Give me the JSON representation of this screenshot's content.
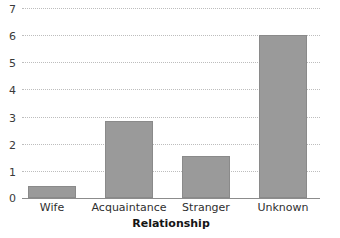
{
  "chart_data": {
    "type": "bar",
    "title": "",
    "subtitle": "",
    "xlabel": "Relationship",
    "ylabel": "",
    "categories": [
      "Wife",
      "Acquaintance",
      "Stranger",
      "Unknown"
    ],
    "values": [
      0.45,
      2.85,
      1.55,
      6.0
    ],
    "series": [
      {
        "name": "Count",
        "values": [
          0.45,
          2.85,
          1.55,
          6.0
        ]
      }
    ],
    "ylim": [
      0,
      7
    ],
    "ytick_labels": [
      "0",
      "1",
      "2",
      "3",
      "4",
      "5",
      "6",
      "7"
    ],
    "ytick_values": [
      0,
      1,
      2,
      3,
      4,
      5,
      6,
      7
    ],
    "xtick_labels": [
      "Wife",
      "Acquaintance",
      "Stranger",
      "Unknown"
    ],
    "grid": true,
    "grid_axis": "y",
    "grid_style": "dotted",
    "legend": false,
    "legend_position": "none",
    "annotations": [],
    "colors": {
      "bar_fill": "#9a9a9a",
      "bar_border": "#8a8a8a",
      "gridline": "#bdbdbd",
      "axis_line": "#8c8c8c",
      "tick_text": "#3a3a3a",
      "axis_title_text": "#151515",
      "background": "#ffffff"
    }
  }
}
